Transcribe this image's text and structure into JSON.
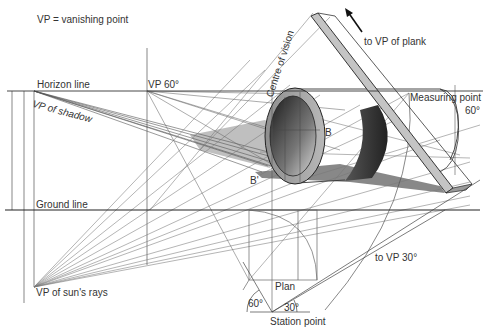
{
  "legend": {
    "note": "VP = vanishing point"
  },
  "labels": {
    "horizon_line": "Horizon line",
    "ground_line": "Ground line",
    "vp_60": "VP 60°",
    "vp_of_shadow": "VP of shadow",
    "vp_of_suns_rays": "VP of sun's rays",
    "centre_of_vision": "Centre of vision",
    "to_vp_of_plank": "to VP of plank",
    "measuring_point": "Measuring point",
    "measuring_angle": "60°",
    "point_b": "B",
    "point_b_prime": "B'",
    "to_vp_30": "to VP 30°",
    "plan": "Plan",
    "station_angle_left": "60°",
    "station_angle_right": "30°",
    "station_point": "Station point"
  },
  "colors": {
    "line": "#444444",
    "thin_line": "#777777",
    "shadow": "#6b6b6b",
    "cylinder_rim": "#9a9a9a",
    "cylinder_inner_dark": "#2a2a2a",
    "plank_face": "#bdbdbd",
    "background": "#ffffff"
  }
}
